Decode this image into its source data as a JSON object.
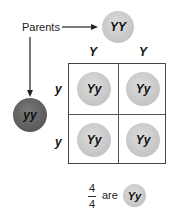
{
  "parents_label": "Parents",
  "parent_top": {
    "genotype": "YY",
    "color": "#c8c8c8"
  },
  "parent_left": {
    "genotype": "yy",
    "color": "#5e5e5e"
  },
  "column_alleles": [
    "Y",
    "Y"
  ],
  "row_alleles": [
    "y",
    "y"
  ],
  "punnett_cells": [
    {
      "genotype": "Yy"
    },
    {
      "genotype": "Yy"
    },
    {
      "genotype": "Yy"
    },
    {
      "genotype": "Yy"
    }
  ],
  "result": {
    "numerator": "4",
    "denominator": "4",
    "word": "are",
    "genotype": "Yy"
  }
}
